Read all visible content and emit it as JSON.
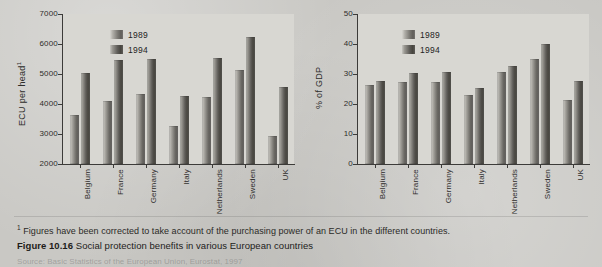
{
  "figure": {
    "caption_number": "Figure 10.16",
    "caption_text": "Social protection benefits in various European countries",
    "footnote": "Figures have been corrected to take account of the purchasing power of an ECU in the different countries.",
    "footnote_marker": "1",
    "source": "Source: Basic Statistics of the European Union, Eurostat, 1997"
  },
  "legend": {
    "series_1_label": "1989",
    "series_2_label": "1994"
  },
  "colors": {
    "page_background": "#c9c8c4",
    "plot_background": "#d8d7d2",
    "axis": "#3c3b39",
    "bar_1989": "#7a7873",
    "bar_1994": "#5e5c58",
    "text": "#2b2b2b"
  },
  "chart_data": [
    {
      "type": "bar",
      "title": "",
      "xlabel": "",
      "ylabel": "ECU per head",
      "ylabel_footnote_marker": "1",
      "ylim": [
        2000,
        7000
      ],
      "yticks": [
        2000,
        3000,
        4000,
        5000,
        6000,
        7000
      ],
      "ytick_labels": [
        "2000",
        "3000",
        "4000",
        "5000",
        "6000",
        "7000"
      ],
      "grid": false,
      "legend_position": "upper-left-inside",
      "categories": [
        "Belgium",
        "France",
        "Germany",
        "Italy",
        "Netherlands",
        "Sweden",
        "UK"
      ],
      "series": [
        {
          "name": "1989",
          "values": [
            3650,
            4100,
            4330,
            3280,
            4220,
            5130,
            2950
          ]
        },
        {
          "name": "1994",
          "values": [
            5050,
            5480,
            5490,
            4260,
            5520,
            6230,
            4560
          ]
        }
      ]
    },
    {
      "type": "bar",
      "title": "",
      "xlabel": "",
      "ylabel": "% of GDP",
      "ylim": [
        0,
        50
      ],
      "yticks": [
        0,
        10,
        20,
        30,
        40,
        50
      ],
      "ytick_labels": [
        "0",
        "10",
        "20",
        "30",
        "40",
        "50"
      ],
      "grid": false,
      "legend_position": "upper-left-inside",
      "categories": [
        "Belgium",
        "France",
        "Germany",
        "Italy",
        "Netherlands",
        "Sweden",
        "UK"
      ],
      "series": [
        {
          "name": "1989",
          "values": [
            26.3,
            27.3,
            27.3,
            22.9,
            30.8,
            35.0,
            21.5
          ]
        },
        {
          "name": "1994",
          "values": [
            27.7,
            30.2,
            30.6,
            25.4,
            32.8,
            40.0,
            27.7
          ]
        }
      ]
    }
  ]
}
